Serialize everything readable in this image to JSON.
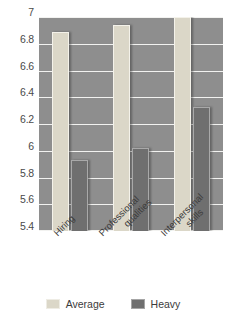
{
  "chart_data": {
    "type": "bar",
    "title": "",
    "subtitle": "",
    "xlabel": "",
    "ylabel": "",
    "categories": [
      "Hiring",
      "Professional qualities",
      "Interpersonal skills"
    ],
    "series": [
      {
        "name": "Average",
        "values": [
          6.89,
          6.94,
          7.0
        ],
        "color": "#dbd7c8"
      },
      {
        "name": "Heavy",
        "values": [
          5.93,
          6.02,
          6.33
        ],
        "color": "#6f6f6f"
      }
    ],
    "ylim": [
      5.4,
      7.0
    ],
    "ytick_labels": [
      "7",
      "6.8",
      "6.6",
      "6.4",
      "6.2",
      "6",
      "5.8",
      "5.6",
      "5.4"
    ],
    "ytick_values": [
      7.0,
      6.8,
      6.6,
      6.4,
      6.2,
      6.0,
      5.8,
      5.6,
      5.4
    ],
    "grid": true,
    "grid_orientation": "horizontal",
    "grid_color": "#f2f2f0",
    "plot_background": "#8e8e8e",
    "legend_position": "bottom",
    "category_label_rotation": -45,
    "category_label_lines": [
      [
        "Hiring"
      ],
      [
        "Professional",
        "qualities"
      ],
      [
        "Interpersonal",
        "skills"
      ]
    ]
  },
  "legend": {
    "items": [
      {
        "label": "Average",
        "color": "#dbd7c8"
      },
      {
        "label": "Heavy",
        "color": "#6f6f6f"
      }
    ]
  }
}
